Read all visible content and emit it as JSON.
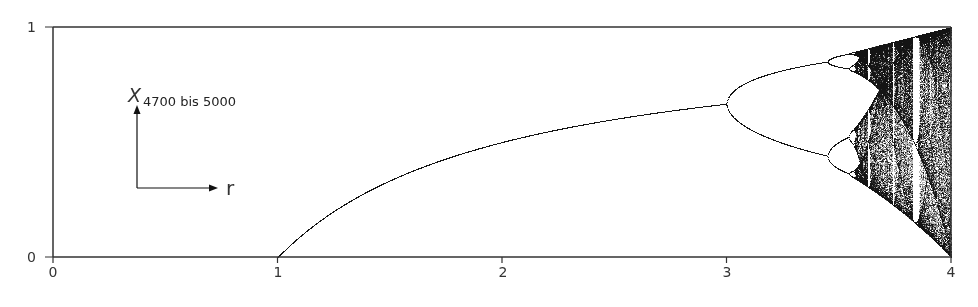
{
  "chart_data": {
    "type": "scatter",
    "title": "",
    "xlabel": "r",
    "ylabel": "X",
    "ylabel_subscript": "4700 bis 5000",
    "xlim": [
      0,
      4
    ],
    "ylim": [
      0,
      1
    ],
    "x_ticks": [
      "0",
      "1",
      "2",
      "3",
      "4"
    ],
    "y_ticks": [
      "0",
      "1"
    ],
    "grid": false,
    "iterations_shown": [
      4700,
      5000
    ],
    "key_points": [
      {
        "r": 1.0,
        "x": 0.0,
        "note": "branch emerges from 0"
      },
      {
        "r": 2.0,
        "x": 0.5
      },
      {
        "r": 3.0,
        "x": 0.667,
        "note": "first period doubling"
      },
      {
        "r": 3.449,
        "note": "period 4"
      },
      {
        "r": 3.57,
        "note": "onset of chaos"
      },
      {
        "r": 3.83,
        "note": "period-3 window"
      },
      {
        "r": 4.0,
        "x_range": [
          0,
          1
        ]
      }
    ],
    "point_color": "#1a1a1a"
  },
  "axes": {
    "x_ticks": [
      "0",
      "1",
      "2",
      "3",
      "4"
    ],
    "y_ticks": [
      "0",
      "1"
    ]
  },
  "legend": {
    "y_symbol": "X",
    "y_subscript": "4700 bis 5000",
    "x_symbol": "r"
  }
}
